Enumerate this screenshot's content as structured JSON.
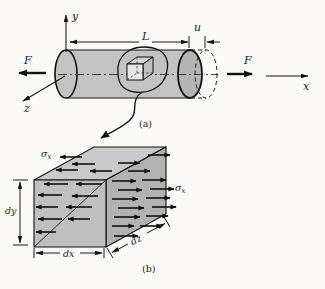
{
  "figure": {
    "part_a": {
      "caption": "(a)",
      "force_label_left": "F",
      "force_label_right": "F",
      "axis_x": "x",
      "axis_y": "y",
      "axis_z": "z",
      "length_label": "L",
      "displacement_label": "u"
    },
    "part_b": {
      "caption": "(b)",
      "stress_symbol": "σ",
      "stress_subscript": "x",
      "dim_dx": "dx",
      "dim_dy": "dy",
      "dim_dz": "dz"
    },
    "colors": {
      "background": "#faf9f6",
      "cylinder_fill": "#c3c3c3",
      "cap_fill": "#b5b5b5",
      "element_front": "#bfbfbf",
      "element_top": "#c9c9c9",
      "element_right": "#b2b2b2",
      "line": "#1a1a1a"
    }
  }
}
